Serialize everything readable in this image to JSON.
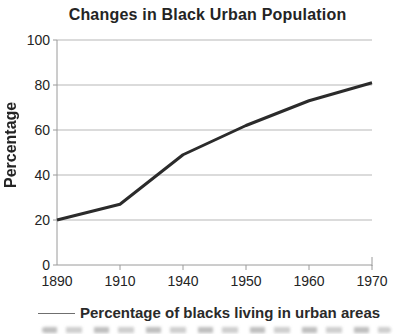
{
  "chart_data": {
    "type": "line",
    "title": "Changes in Black Urban Population",
    "categories": [
      "1890",
      "1910",
      "1940",
      "1950",
      "1960",
      "1970"
    ],
    "series": [
      {
        "name": "Percentage of blacks living in urban areas",
        "values": [
          20,
          27,
          49,
          62,
          73,
          81
        ]
      }
    ],
    "xlabel": "",
    "ylabel": "Percentage",
    "ylim": [
      0,
      100
    ],
    "ytick_step": 20,
    "yticks": [
      0,
      20,
      40,
      60,
      80,
      100
    ],
    "grid": "horizontal",
    "legend_position": "bottom",
    "colors": {
      "line": "#2b2b2b",
      "grid": "#b7b7b7",
      "axis": "#9a9a9a",
      "text": "#242424"
    }
  }
}
